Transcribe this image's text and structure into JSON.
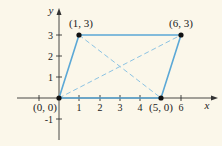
{
  "figure": {
    "axes": {
      "x_label": "x",
      "y_label": "y",
      "x_ticks": [
        "1",
        "2",
        "3",
        "4",
        "6"
      ],
      "y_ticks": [
        "3",
        "2",
        "1",
        "-1"
      ]
    },
    "points": [
      {
        "label": "(0, 0)",
        "x": 0,
        "y": 0
      },
      {
        "label": "(1, 3)",
        "x": 1,
        "y": 3
      },
      {
        "label": "(6, 3)",
        "x": 6,
        "y": 3
      },
      {
        "label": "(5, 0)",
        "x": 5,
        "y": 0
      }
    ],
    "parallelogram_color": "#5ba8d6",
    "diagonal_color": "#8cc3e3",
    "background": "#fbf7ea"
  }
}
